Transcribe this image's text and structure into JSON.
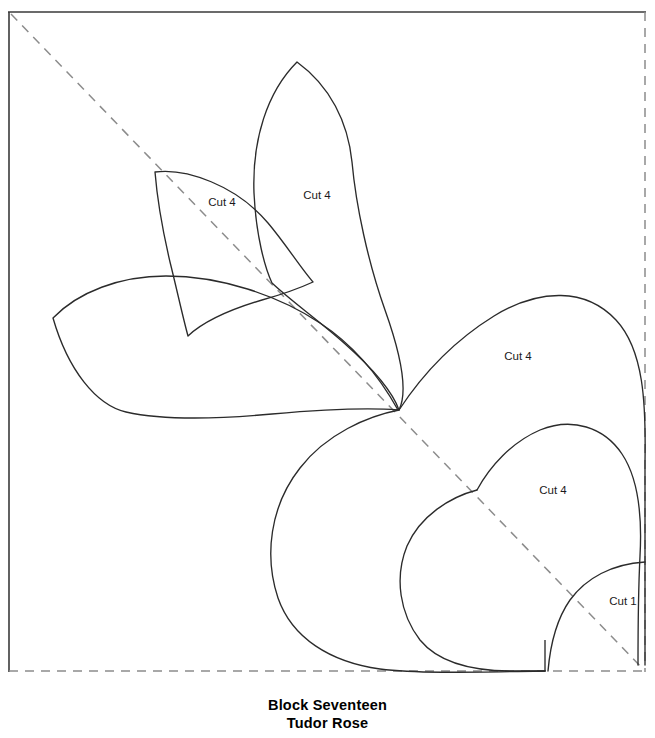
{
  "document": {
    "title": "Block Seventeen",
    "subtitle": "Tudor Rose"
  },
  "caption": {
    "block_name": "Block Seventeen",
    "pattern_name": "Tudor Rose"
  },
  "colors": {
    "outline": "#2b2b2b",
    "dashed": "#8c8c8c",
    "border_solid": "#3a3a3a",
    "background": "#ffffff",
    "label_text": "#1a1a1a"
  },
  "frame": {
    "left_edge_style": "solid",
    "top_edge_style": "solid",
    "right_edge_style": "dashed",
    "bottom_edge_style": "dashed",
    "diagonal_style": "dashed",
    "diagonal_from": "top-left",
    "diagonal_to": "bottom-right"
  },
  "pieces": [
    {
      "id": "small-leaf",
      "label": "Cut 4",
      "label_x": 222,
      "label_y": 203
    },
    {
      "id": "large-top-petal",
      "label": "Cut 4",
      "label_x": 317,
      "label_y": 196
    },
    {
      "id": "large-right-petal",
      "label": "Cut 4",
      "label_x": 518,
      "label_y": 357
    },
    {
      "id": "inner-right-petal",
      "label": "Cut 4",
      "label_x": 553,
      "label_y": 491
    },
    {
      "id": "corner-piece",
      "label": "Cut 1",
      "label_x": 623,
      "label_y": 602
    }
  ]
}
